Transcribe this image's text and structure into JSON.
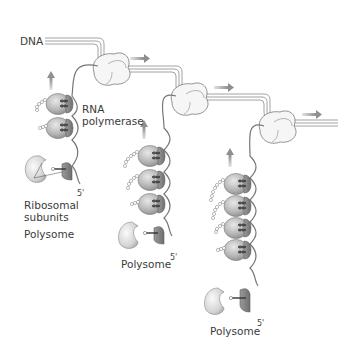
{
  "figure": {
    "panel_label": "(a)",
    "labels": {
      "dna": "DNA",
      "rna_polymerase_line1": "RNA",
      "rna_polymerase_line2": "polymerase",
      "ribosomal_line1": "Ribosomal",
      "ribosomal_line2": "subunits",
      "polysome_1": "Polysome",
      "polysome_2": "Polysome",
      "polysome_3": "Polysome",
      "five_prime_1": "5'",
      "five_prime_2": "5'",
      "five_prime_3": "5'"
    },
    "colors": {
      "dna_strand": "#8a8a8a",
      "polymerase_fill": "#f4f4f4",
      "ribosome_large": "#bdbdbd",
      "ribosome_small": "#8c8c8c",
      "arrow": "#9a9a9a",
      "mrna": "#777777"
    },
    "units": [
      {
        "name": "transcription-unit-1",
        "ribosomes": 3
      },
      {
        "name": "transcription-unit-2",
        "ribosomes": 4
      },
      {
        "name": "transcription-unit-3",
        "ribosomes": 5
      }
    ]
  }
}
